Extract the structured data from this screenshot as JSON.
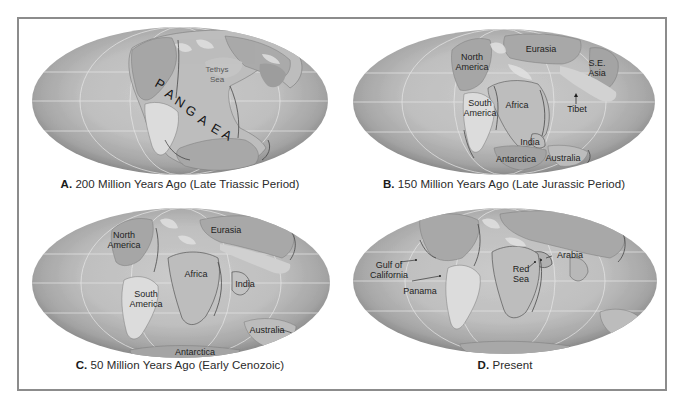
{
  "figure": {
    "frame_color": "#8c8c8c",
    "ocean_edge_color": "#8e8e8e",
    "ocean_center_color": "#c6c6c6",
    "land_light_color": "#dadada",
    "land_mid_color": "#bdbdbd",
    "land_dark_color": "#a4a4a4",
    "graticule_color": "#e8e8e8"
  },
  "panels": [
    {
      "id": "A",
      "letter": "A.",
      "caption": " 200 Million Years Ago (Late Triassic Period)",
      "labels": {
        "supercontinent_letters": [
          "P",
          "A",
          "N",
          "G",
          "A",
          "E",
          "A"
        ],
        "tethys": "Tethys\nSea"
      }
    },
    {
      "id": "B",
      "letter": "B.",
      "caption": " 150 Million Years Ago (Late Jurassic Period)",
      "labels": {
        "north_america": "North\nAmerica",
        "eurasia": "Eurasia",
        "se_asia": "S.E.\nAsia",
        "south_america": "South\nAmerica",
        "africa": "Africa",
        "tibet": "Tibet",
        "india": "India",
        "antarctica": "Antarctica",
        "australia": "Australia"
      }
    },
    {
      "id": "C",
      "letter": "C.",
      "caption": " 50 Million Years Ago (Early Cenozoic)",
      "labels": {
        "north_america": "North\nAmerica",
        "eurasia": "Eurasia",
        "africa": "Africa",
        "india": "India",
        "south_america": "South\nAmerica",
        "australia": "Australia",
        "antarctica": "Antarctica"
      }
    },
    {
      "id": "D",
      "letter": "D.",
      "caption": " Present",
      "labels": {
        "gulf_of_california": "Gulf of\nCalifornia",
        "panama": "Panama",
        "red_sea": "Red\nSea",
        "arabia": "Arabia"
      }
    }
  ]
}
